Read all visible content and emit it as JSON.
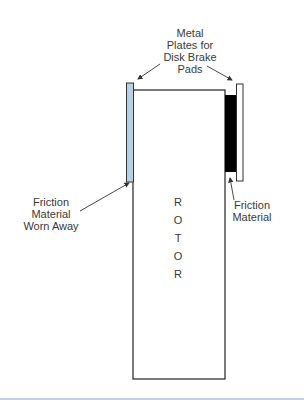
{
  "diagram": {
    "title_label": "Metal Plates for Disk Brake Pads",
    "title_lines": [
      "Metal",
      "Plates for",
      "Disk Brake",
      "Pads"
    ],
    "left_label_lines": [
      "Friction",
      "Material",
      "Worn Away"
    ],
    "right_label_lines": [
      "Friction",
      "Material"
    ],
    "rotor_letters": [
      "R",
      "O",
      "T",
      "O",
      "R"
    ],
    "components": [
      {
        "name": "rotor",
        "color": "#ffffff",
        "stroke": "#333333"
      },
      {
        "name": "left-metal-plate",
        "color": "#b8cfe8"
      },
      {
        "name": "right-friction-material",
        "color": "#000000"
      },
      {
        "name": "right-metal-plate",
        "color": "#ffffff"
      }
    ],
    "colors": {
      "worn_plate": "#b8cfe8",
      "friction": "#000000",
      "outline": "#333333",
      "bottom_rule": "#b9d3ee"
    }
  }
}
